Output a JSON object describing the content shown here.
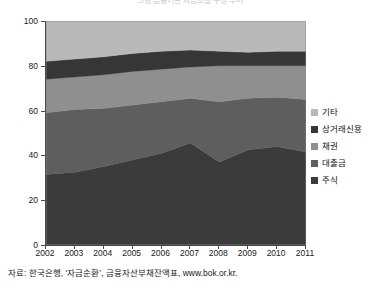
{
  "chart_data": {
    "type": "area",
    "title": "그림  금융기관 자금조달 구성 추이",
    "xlabel": "",
    "ylabel": "",
    "stacked": true,
    "normalized_percent": true,
    "ylim": [
      0,
      100
    ],
    "yticks": [
      0,
      20,
      40,
      60,
      80,
      100
    ],
    "grid": false,
    "legend_position": "right",
    "categories": [
      "2002",
      "2003",
      "2004",
      "2005",
      "2006",
      "2007",
      "2008",
      "2009",
      "2010",
      "2011"
    ],
    "series": [
      {
        "name": "주식",
        "color": "#3b3b3b",
        "values": [
          31.5,
          32.5,
          35.0,
          38.0,
          41.0,
          45.5,
          37.0,
          42.5,
          44.0,
          41.5
        ]
      },
      {
        "name": "대출금",
        "color": "#5e5e5e",
        "values": [
          27.5,
          28.0,
          26.0,
          24.5,
          23.0,
          20.0,
          27.0,
          23.0,
          22.0,
          23.5
        ]
      },
      {
        "name": "채권",
        "color": "#8f8f8f",
        "values": [
          15.0,
          14.5,
          15.0,
          15.0,
          14.5,
          14.0,
          16.0,
          14.5,
          14.0,
          15.0
        ]
      },
      {
        "name": "상거래신용",
        "color": "#363636",
        "values": [
          8.0,
          8.0,
          8.0,
          8.0,
          8.0,
          7.5,
          6.5,
          6.0,
          6.5,
          6.5
        ]
      },
      {
        "name": "기타",
        "color": "#b9b9b9",
        "values": [
          18.0,
          17.0,
          16.0,
          14.5,
          13.5,
          13.0,
          13.5,
          14.0,
          13.5,
          13.5
        ]
      }
    ],
    "legend_order_top_to_bottom": [
      "기타",
      "상거래신용",
      "채권",
      "대출금",
      "주식"
    ]
  },
  "axes": {
    "y_tick_labels": [
      "100",
      "80",
      "60",
      "40",
      "20",
      "0"
    ],
    "x_tick_labels": [
      "2002",
      "2003",
      "2004",
      "2005",
      "2006",
      "2007",
      "2008",
      "2009",
      "2010",
      "2011"
    ]
  },
  "legend": {
    "items": [
      {
        "label": "기타",
        "color": "#b9b9b9"
      },
      {
        "label": "상거래신용",
        "color": "#363636"
      },
      {
        "label": "채권",
        "color": "#8f8f8f"
      },
      {
        "label": "대출금",
        "color": "#5e5e5e"
      },
      {
        "label": "주식",
        "color": "#3b3b3b"
      }
    ]
  },
  "source": {
    "text": "자료: 한국은행, ‘자금순환’, 금융자산부채잔액표, www.bok.or.kr."
  },
  "colors": {
    "axis": "#4a4a4a",
    "text": "#1a1a1a",
    "background": "#ffffff"
  }
}
